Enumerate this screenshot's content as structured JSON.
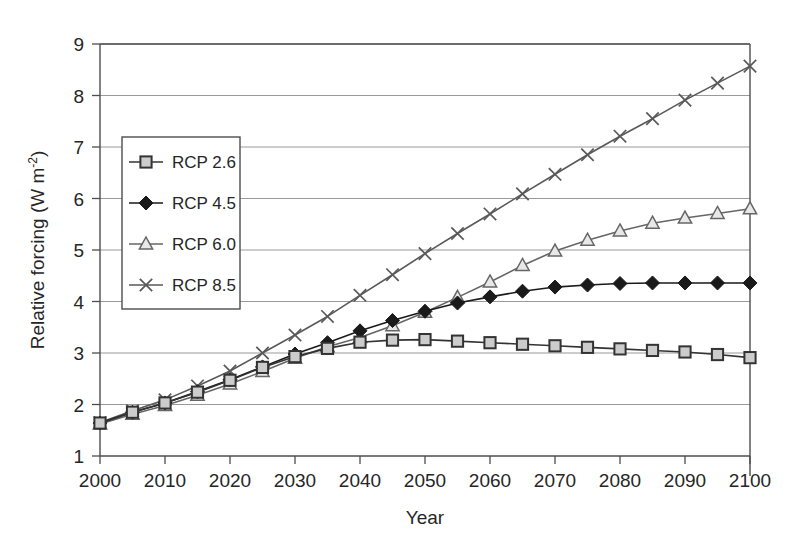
{
  "chart_data": {
    "type": "line",
    "title": "",
    "xlabel": "Year",
    "ylabel": "Relative forcing (W m⁻²)",
    "ylabel_main": "Relative forcing (W m",
    "ylabel_sup": "-2",
    "ylabel_tail": ")",
    "xlim": [
      2000,
      2100
    ],
    "ylim": [
      1,
      9
    ],
    "grid": true,
    "grid_axis": "y",
    "legend_position": "upper-left-inside",
    "xticks": [
      2000,
      2010,
      2020,
      2030,
      2040,
      2050,
      2060,
      2070,
      2080,
      2090,
      2100
    ],
    "yticks": [
      1,
      2,
      3,
      4,
      5,
      6,
      7,
      8,
      9
    ],
    "x": [
      2000,
      2005,
      2010,
      2015,
      2020,
      2025,
      2030,
      2035,
      2040,
      2045,
      2050,
      2055,
      2060,
      2065,
      2070,
      2075,
      2080,
      2085,
      2090,
      2095,
      2100
    ],
    "series": [
      {
        "name": "RCP 2.6",
        "marker": "open-square",
        "color": "#333333",
        "marker_fill": "#cccccc",
        "values": [
          1.64,
          1.85,
          2.03,
          2.24,
          2.47,
          2.72,
          2.93,
          3.09,
          3.21,
          3.25,
          3.26,
          3.23,
          3.2,
          3.17,
          3.14,
          3.11,
          3.08,
          3.05,
          3.02,
          2.97,
          2.91
        ]
      },
      {
        "name": "RCP 4.5",
        "marker": "filled-diamond",
        "color": "#1a1a1a",
        "marker_fill": "#1a1a1a",
        "values": [
          1.64,
          1.85,
          2.03,
          2.25,
          2.48,
          2.73,
          2.98,
          3.2,
          3.43,
          3.63,
          3.81,
          3.97,
          4.09,
          4.2,
          4.28,
          4.32,
          4.35,
          4.36,
          4.36,
          4.36,
          4.36
        ]
      },
      {
        "name": "RCP 6.0",
        "marker": "open-triangle",
        "color": "#666666",
        "marker_fill": "#e8e8e8",
        "values": [
          1.62,
          1.81,
          1.98,
          2.18,
          2.4,
          2.64,
          2.9,
          3.12,
          3.3,
          3.53,
          3.79,
          4.08,
          4.38,
          4.7,
          4.98,
          5.19,
          5.37,
          5.52,
          5.62,
          5.71,
          5.8
        ]
      },
      {
        "name": "RCP 8.5",
        "marker": "cross-x",
        "color": "#595959",
        "marker_fill": "none",
        "values": [
          1.65,
          1.88,
          2.09,
          2.36,
          2.65,
          3.0,
          3.35,
          3.71,
          4.12,
          4.52,
          4.93,
          5.32,
          5.7,
          6.09,
          6.47,
          6.85,
          7.21,
          7.55,
          7.91,
          8.24,
          8.57
        ]
      }
    ]
  }
}
